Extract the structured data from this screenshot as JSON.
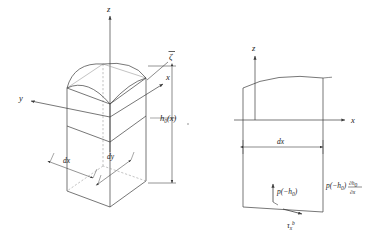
{
  "figure": {
    "type": "technical-diagram",
    "stroke_color": "#3c3c3c",
    "dashed_color": "#8c8c8c",
    "text_color": "#1a1a1a",
    "background": "#ffffff"
  },
  "left_panel": {
    "name": "three-dimensional-control-volume",
    "axes": {
      "z_label": "z",
      "x_label": "x",
      "y_label": "y"
    },
    "labels": {
      "surface_elevation": "ζ",
      "surface_elevation_overbar": true,
      "depth": "h",
      "depth_subscript": "0",
      "depth_argument": "(x)",
      "dx": "dx",
      "dy": "dy"
    }
  },
  "right_panel": {
    "name": "cross-section-x-z",
    "axes": {
      "z_label": "z",
      "x_label": "x"
    },
    "labels": {
      "dx": "dx",
      "pressure_left": "p(−h",
      "pressure_left_sub": "0",
      "pressure_left_close": ")",
      "pressure_right": "p(−h",
      "pressure_right_sub": "0",
      "pressure_right_mid": ")",
      "pressure_right_partial": "∂h",
      "pressure_right_partial_sub": "0",
      "pressure_right_denom": "∂x",
      "bed_shear": "τ",
      "bed_shear_sub": "x",
      "bed_shear_sup": "b"
    }
  }
}
